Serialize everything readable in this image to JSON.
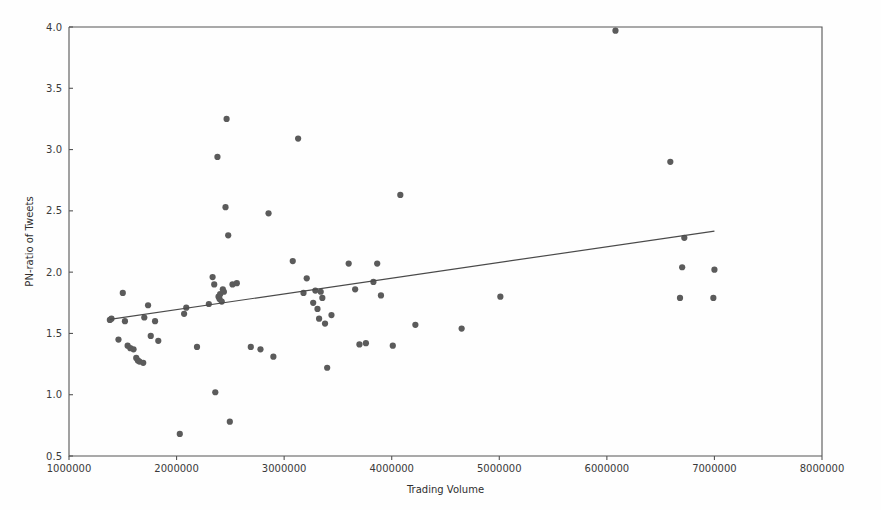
{
  "chart_data": {
    "type": "scatter",
    "title": "",
    "xlabel": "Trading Volume",
    "ylabel": "PN-ratio of Tweets",
    "xlim": [
      1000000,
      8000000
    ],
    "ylim": [
      0.5,
      4.0
    ],
    "grid": false,
    "legend": null,
    "xticks": [
      1000000,
      2000000,
      3000000,
      4000000,
      5000000,
      6000000,
      7000000,
      8000000
    ],
    "xtick_labels": [
      "1000000",
      "2000000",
      "3000000",
      "4000000",
      "5000000",
      "6000000",
      "7000000",
      "8000000"
    ],
    "yticks": [
      0.5,
      1.0,
      1.5,
      2.0,
      2.5,
      3.0,
      3.5,
      4.0
    ],
    "ytick_labels": [
      "0.5",
      "1.0",
      "1.5",
      "2.0",
      "2.5",
      "3.0",
      "3.5",
      "4.0"
    ],
    "marker_color": "#5b5b5b",
    "marker_size": 4.2,
    "series": [
      {
        "name": "observations",
        "points": [
          [
            1380000,
            1.61
          ],
          [
            1395000,
            1.62
          ],
          [
            1460000,
            1.45
          ],
          [
            1500000,
            1.83
          ],
          [
            1520000,
            1.6
          ],
          [
            1545000,
            1.4
          ],
          [
            1570000,
            1.38
          ],
          [
            1600000,
            1.37
          ],
          [
            1625000,
            1.3
          ],
          [
            1640000,
            1.28
          ],
          [
            1655000,
            1.27
          ],
          [
            1690000,
            1.26
          ],
          [
            1700000,
            1.63
          ],
          [
            1735000,
            1.73
          ],
          [
            1760000,
            1.48
          ],
          [
            1800000,
            1.6
          ],
          [
            1830000,
            1.44
          ],
          [
            2030000,
            0.68
          ],
          [
            2070000,
            1.66
          ],
          [
            2090000,
            1.71
          ],
          [
            2190000,
            1.39
          ],
          [
            2300000,
            1.74
          ],
          [
            2335000,
            1.96
          ],
          [
            2350000,
            1.9
          ],
          [
            2360000,
            1.02
          ],
          [
            2380000,
            2.94
          ],
          [
            2390000,
            1.8
          ],
          [
            2400000,
            1.78
          ],
          [
            2405000,
            1.82
          ],
          [
            2420000,
            1.76
          ],
          [
            2430000,
            1.86
          ],
          [
            2440000,
            1.84
          ],
          [
            2455000,
            2.53
          ],
          [
            2465000,
            3.25
          ],
          [
            2480000,
            2.3
          ],
          [
            2495000,
            0.78
          ],
          [
            2520000,
            1.9
          ],
          [
            2560000,
            1.91
          ],
          [
            2690000,
            1.39
          ],
          [
            2780000,
            1.37
          ],
          [
            2855000,
            2.48
          ],
          [
            2900000,
            1.31
          ],
          [
            3080000,
            2.09
          ],
          [
            3130000,
            3.09
          ],
          [
            3180000,
            1.83
          ],
          [
            3210000,
            1.95
          ],
          [
            3270000,
            1.75
          ],
          [
            3290000,
            1.85
          ],
          [
            3310000,
            1.7
          ],
          [
            3325000,
            1.62
          ],
          [
            3340000,
            1.84
          ],
          [
            3355000,
            1.79
          ],
          [
            3380000,
            1.58
          ],
          [
            3400000,
            1.22
          ],
          [
            3440000,
            1.65
          ],
          [
            3600000,
            2.07
          ],
          [
            3660000,
            1.86
          ],
          [
            3700000,
            1.41
          ],
          [
            3760000,
            1.42
          ],
          [
            3830000,
            1.92
          ],
          [
            3865000,
            2.07
          ],
          [
            3900000,
            1.81
          ],
          [
            4010000,
            1.4
          ],
          [
            4080000,
            2.63
          ],
          [
            4220000,
            1.57
          ],
          [
            4650000,
            1.54
          ],
          [
            5010000,
            1.8
          ],
          [
            6080000,
            3.97
          ],
          [
            6590000,
            2.9
          ],
          [
            6680000,
            1.79
          ],
          [
            6700000,
            2.04
          ],
          [
            6720000,
            2.28
          ],
          [
            6990000,
            1.79
          ],
          [
            7000000,
            2.02
          ]
        ]
      }
    ],
    "trendline": {
      "name": "linear fit",
      "x_start": 1380000,
      "y_start": 1.615,
      "x_end": 7000000,
      "y_end": 2.335,
      "color": "#4a4a4a"
    }
  }
}
